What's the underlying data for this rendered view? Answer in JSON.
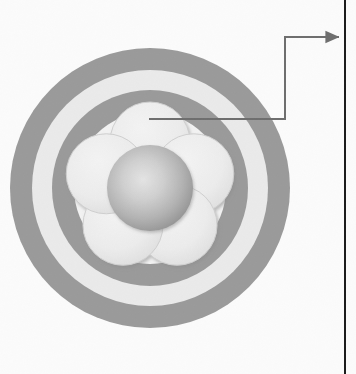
{
  "figure": {
    "name": "concentric-ring-flower-cross-section",
    "background_color": "#fbfbfb",
    "width": 356,
    "height": 374
  },
  "palette": {
    "page_background": "#fbfbfb",
    "ring_dark": "#9a9a9a",
    "ring_light": "#e9e9e9",
    "ring_inner_light": "#f2f2f2",
    "petal_fill": "#ebebeb",
    "petal_edge": "#c9c9c9",
    "petal_shadow": "#b4b4b4",
    "core_highlight": "#e2e2e2",
    "core_mid": "#b8b8b8",
    "core_shadow": "#8f8f8f",
    "leader_line": "#6e6e6e",
    "rule_line": "#1b1b1b"
  },
  "rings": [
    {
      "name": "outer-dark-ring",
      "radius": 140,
      "color": "#9a9a9a"
    },
    {
      "name": "outer-light-ring",
      "radius": 118,
      "color": "#eaeaea"
    },
    {
      "name": "inner-dark-ring",
      "radius": 98,
      "color": "#9a9a9a"
    },
    {
      "name": "inner-light-field",
      "radius": 76,
      "color": "#f2f2f2"
    }
  ],
  "flower": {
    "name": "five-petal-rosette",
    "center_x": 166,
    "center_y": 208,
    "petal_count": 5,
    "petal_radius": 40,
    "petal_orbit_radius": 46,
    "petal_start_angle_deg": -90,
    "core_radius": 43,
    "petals": [
      {
        "name": "petal-top",
        "angle_deg": -90,
        "cx": 166,
        "cy": 162
      },
      {
        "name": "petal-upper-right",
        "angle_deg": -18,
        "cx": 210,
        "cy": 194
      },
      {
        "name": "petal-lower-right",
        "angle_deg": 54,
        "cx": 193,
        "cy": 245
      },
      {
        "name": "petal-lower-left",
        "angle_deg": 126,
        "cx": 139,
        "cy": 245
      },
      {
        "name": "petal-upper-left",
        "angle_deg": 198,
        "cx": 122,
        "cy": 194
      }
    ]
  },
  "callout": {
    "name": "petal-callout",
    "anchor_x": 166,
    "anchor_y": 119,
    "horizontal_run_to_x": 285,
    "vertical_rise_to_y": 37,
    "arrow_tip_x": 344,
    "arrow_tip_y": 37,
    "stroke_color": "#6e6e6e",
    "stroke_width": 2
  },
  "page_rule": {
    "name": "right-margin-rule",
    "x": 345,
    "color": "#1b1b1b",
    "width": 2
  }
}
